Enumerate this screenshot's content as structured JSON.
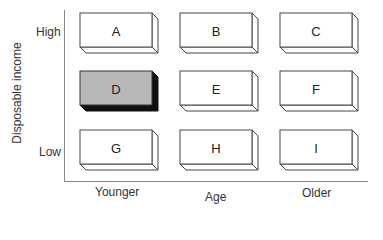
{
  "diagram": {
    "type": "3x3 segmentation matrix",
    "y_axis": {
      "title": "Disposable income",
      "high_label": "High",
      "low_label": "Low"
    },
    "x_axis": {
      "title": "Age",
      "left_label": "Younger",
      "right_label": "Older"
    },
    "highlight_color": "#b8b8b8",
    "cells": [
      {
        "label": "A",
        "row": 0,
        "col": 0,
        "highlighted": false
      },
      {
        "label": "B",
        "row": 0,
        "col": 1,
        "highlighted": false
      },
      {
        "label": "C",
        "row": 0,
        "col": 2,
        "highlighted": false
      },
      {
        "label": "D",
        "row": 1,
        "col": 0,
        "highlighted": true
      },
      {
        "label": "E",
        "row": 1,
        "col": 1,
        "highlighted": false
      },
      {
        "label": "F",
        "row": 1,
        "col": 2,
        "highlighted": false
      },
      {
        "label": "G",
        "row": 2,
        "col": 0,
        "highlighted": false
      },
      {
        "label": "H",
        "row": 2,
        "col": 1,
        "highlighted": false
      },
      {
        "label": "I",
        "row": 2,
        "col": 2,
        "highlighted": false
      }
    ]
  }
}
